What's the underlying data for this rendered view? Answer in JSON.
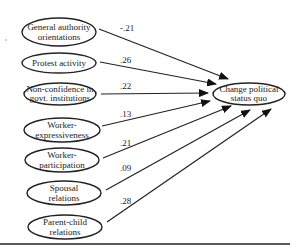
{
  "diagram": {
    "target": {
      "line1": "Change political",
      "line2": "status quo"
    },
    "predictors": [
      {
        "line1": "General authority",
        "line2": "orientations",
        "coef": "-.21"
      },
      {
        "line1": "Protest activity",
        "line2": "",
        "coef": ".26"
      },
      {
        "line1": "Non-confidence in",
        "line2": "govt. institutions",
        "coef": ".22"
      },
      {
        "line1": "Worker-",
        "line2": "expressiveness",
        "coef": ".13"
      },
      {
        "line1": "Worker-",
        "line2": "participation",
        "coef": ".21"
      },
      {
        "line1": "Spousal",
        "line2": "relations",
        "coef": ".09"
      },
      {
        "line1": "Parent-child",
        "line2": "relations",
        "coef": ".28"
      }
    ]
  }
}
